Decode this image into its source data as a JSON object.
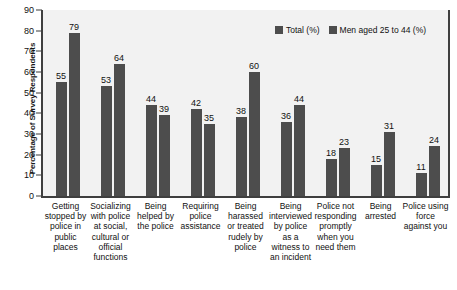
{
  "chart_data": {
    "type": "bar",
    "title": "",
    "xlabel": "",
    "ylabel": "Percentage of Survey Respondents",
    "ylim": [
      0,
      90
    ],
    "yticks": [
      0,
      10,
      20,
      30,
      40,
      50,
      60,
      70,
      80,
      90
    ],
    "grid": false,
    "legend_position": "top-right",
    "bar_color": "#4d4d4d",
    "plot_background": "#f2f2f2",
    "categories": [
      "Getting stopped by police in public places",
      "Socializing with police at social, cultural or official functions",
      "Being helped by the police",
      "Requiring police assistance",
      "Being harassed or treated rudely by police",
      "Being interviewed by police as a witness to an incident",
      "Police not responding promptly when you need them",
      "Being arrested",
      "Police using force against you"
    ],
    "category_lines": [
      [
        "Getting",
        "stopped by",
        "police in",
        "public",
        "places"
      ],
      [
        "Socializing",
        "with police",
        "at social,",
        "cultural or",
        "official",
        "functions"
      ],
      [
        "Being",
        "helped by",
        "the police"
      ],
      [
        "Requiring",
        "police",
        "assistance"
      ],
      [
        "Being",
        "harassed",
        "or treated",
        "rudely by",
        "police"
      ],
      [
        "Being",
        "interviewed",
        "by police",
        "as a",
        "witness to",
        "an incident"
      ],
      [
        "Police not",
        "responding",
        "promptly",
        "when you",
        "need them"
      ],
      [
        "Being",
        "arrested"
      ],
      [
        "Police using",
        "force",
        "against you"
      ]
    ],
    "series": [
      {
        "name": "Total (%)",
        "values": [
          55,
          53,
          44,
          42,
          38,
          36,
          18,
          15,
          11
        ]
      },
      {
        "name": "Men aged 25 to 44 (%)",
        "values": [
          79,
          64,
          39,
          35,
          60,
          44,
          23,
          31,
          24
        ]
      }
    ]
  }
}
